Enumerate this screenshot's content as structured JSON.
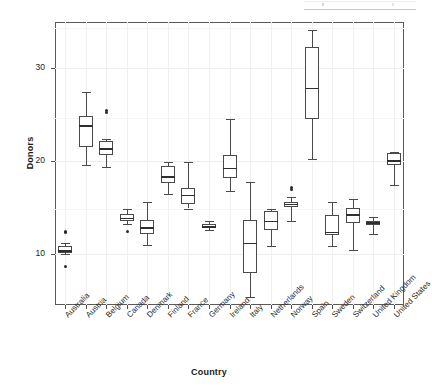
{
  "chart_data": {
    "type": "boxplot",
    "title": "",
    "xlabel": "Country",
    "ylabel": "Donors",
    "ylim": [
      4.5,
      35.0
    ],
    "yticks": [
      10,
      20,
      30
    ],
    "ytick_labels": [
      "10",
      "20",
      "30"
    ],
    "grid": true,
    "grid_axes": "both",
    "legend": "none",
    "categories": [
      "Australia",
      "Austria",
      "Belgium",
      "Canada",
      "Denmark",
      "Finland",
      "France",
      "Germany",
      "Ireland",
      "Italy",
      "Netherlands",
      "Norway",
      "Spain",
      "Sweden",
      "Switzerland",
      "United Kingdom",
      "United States"
    ],
    "boxes": [
      {
        "category": "Australia",
        "whisker_low": 10.0,
        "q1": 10.1,
        "median": 10.4,
        "q3": 10.9,
        "whisker_high": 11.2,
        "outliers": [
          12.4,
          12.3,
          8.7
        ]
      },
      {
        "category": "Austria",
        "whisker_low": 19.6,
        "q1": 21.5,
        "median": 23.9,
        "q3": 24.9,
        "whisker_high": 27.5,
        "outliers": []
      },
      {
        "category": "Belgium",
        "whisker_low": 19.4,
        "q1": 20.7,
        "median": 21.4,
        "q3": 22.2,
        "whisker_high": 22.4,
        "outliers": [
          25.5,
          25.3
        ]
      },
      {
        "category": "Canada",
        "whisker_low": 13.2,
        "q1": 13.6,
        "median": 13.9,
        "q3": 14.3,
        "whisker_high": 14.9,
        "outliers": [
          12.4
        ]
      },
      {
        "category": "Denmark",
        "whisker_low": 11.0,
        "q1": 12.2,
        "median": 12.9,
        "q3": 13.7,
        "whisker_high": 15.6,
        "outliers": []
      },
      {
        "category": "Finland",
        "whisker_low": 16.5,
        "q1": 17.6,
        "median": 18.4,
        "q3": 19.5,
        "whisker_high": 19.9,
        "outliers": []
      },
      {
        "category": "France",
        "whisker_low": 14.9,
        "q1": 15.4,
        "median": 16.4,
        "q3": 17.1,
        "whisker_high": 19.9,
        "outliers": []
      },
      {
        "category": "Germany",
        "whisker_low": 12.6,
        "q1": 12.9,
        "median": 13.0,
        "q3": 13.2,
        "whisker_high": 13.6,
        "outliers": []
      },
      {
        "category": "Ireland",
        "whisker_low": 16.8,
        "q1": 18.2,
        "median": 19.3,
        "q3": 20.7,
        "whisker_high": 24.5,
        "outliers": []
      },
      {
        "category": "Italy",
        "whisker_low": 5.4,
        "q1": 8.0,
        "median": 11.2,
        "q3": 13.7,
        "whisker_high": 17.8,
        "outliers": []
      },
      {
        "category": "Netherlands",
        "whisker_low": 10.9,
        "q1": 12.6,
        "median": 13.6,
        "q3": 14.6,
        "whisker_high": 14.9,
        "outliers": []
      },
      {
        "category": "Norway",
        "whisker_low": 13.6,
        "q1": 15.1,
        "median": 15.4,
        "q3": 15.6,
        "whisker_high": 16.1,
        "outliers": [
          17.2,
          16.9
        ]
      },
      {
        "category": "Spain",
        "whisker_low": 20.2,
        "q1": 24.5,
        "median": 27.9,
        "q3": 32.3,
        "whisker_high": 34.1,
        "outliers": []
      },
      {
        "category": "Sweden",
        "whisker_low": 10.9,
        "q1": 12.0,
        "median": 12.4,
        "q3": 14.2,
        "whisker_high": 15.6,
        "outliers": []
      },
      {
        "category": "Switzerland",
        "whisker_low": 10.4,
        "q1": 13.3,
        "median": 14.3,
        "q3": 15.0,
        "whisker_high": 15.9,
        "outliers": []
      },
      {
        "category": "United Kingdom",
        "whisker_low": 12.1,
        "q1": 13.1,
        "median": 13.4,
        "q3": 13.6,
        "whisker_high": 14.0,
        "outliers": []
      },
      {
        "category": "United States",
        "whisker_low": 17.4,
        "q1": 19.6,
        "median": 20.1,
        "q3": 20.9,
        "whisker_high": 21.0,
        "outliers": []
      }
    ],
    "colors": {
      "box_stroke": "#4a4a4a",
      "median": "#2f2f2f",
      "grid": "#ededed",
      "frame": "#5a5a5a",
      "outlier": "#2b2b2b",
      "background": "#ffffff"
    }
  }
}
